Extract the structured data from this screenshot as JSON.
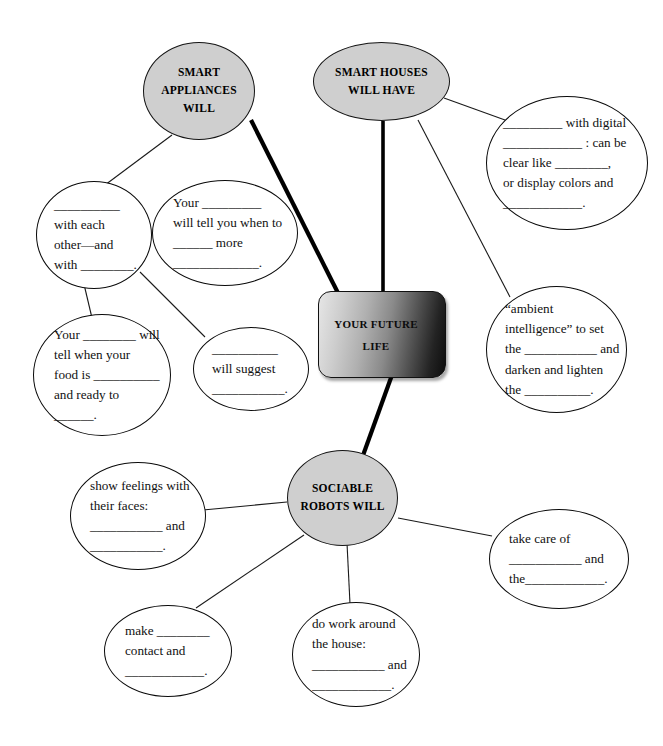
{
  "diagram": {
    "center": {
      "label_line1": "YOUR FUTURE",
      "label_line2": "LIFE",
      "shape": "rounded-rectangle",
      "fill_gradient_from": "#e6e6e6",
      "fill_gradient_to": "#0d0d0d"
    },
    "main_nodes": [
      {
        "id": "smart-appliances",
        "line1": "SMART",
        "line2": "APPLIANCES",
        "line3": "WILL",
        "fill": "#cfcfcf"
      },
      {
        "id": "smart-houses",
        "line1": "SMART HOUSES",
        "line2": "WILL HAVE",
        "line3": "",
        "fill": "#cfcfcf"
      },
      {
        "id": "sociable-robots",
        "line1": "SOCIABLE",
        "line2": "ROBOTS WILL",
        "line3": "",
        "fill": "#cfcfcf"
      }
    ],
    "detail_bubbles": [
      {
        "id": "appliances-talk",
        "parent": "smart-appliances",
        "lines": [
          "__________",
          "with each",
          "other—and",
          "with ________."
        ]
      },
      {
        "id": "appliances-remind",
        "parent": "smart-appliances",
        "lines": [
          "Your _________",
          "will tell you when to",
          "______ more",
          "_____________."
        ]
      },
      {
        "id": "appliances-food",
        "parent": "appliances-talk",
        "lines": [
          "Your ________ will",
          "tell when your",
          "food is __________",
          "and ready to",
          "______."
        ]
      },
      {
        "id": "appliances-suggest",
        "parent": "smart-appliances",
        "lines": [
          "__________",
          "will suggest",
          "___________."
        ]
      },
      {
        "id": "houses-windows",
        "parent": "smart-houses",
        "lines": [
          "_________ with digital",
          "____________ : can be",
          "clear like ________,",
          "or display colors and",
          "____________."
        ]
      },
      {
        "id": "houses-ambient",
        "parent": "smart-houses",
        "lines": [
          "“ambient",
          "intelligence” to set",
          "the ___________ and",
          "darken and lighten",
          "the __________."
        ]
      },
      {
        "id": "robots-feelings",
        "parent": "sociable-robots",
        "lines": [
          "show feelings with",
          "their faces:",
          "___________ and",
          "___________."
        ]
      },
      {
        "id": "robots-care",
        "parent": "sociable-robots",
        "lines": [
          "take care of",
          "___________ and",
          "the____________."
        ]
      },
      {
        "id": "robots-contact",
        "parent": "sociable-robots",
        "lines": [
          "make ________",
          "contact and",
          "____________."
        ]
      },
      {
        "id": "robots-housework",
        "parent": "sociable-robots",
        "lines": [
          "do work around",
          "the house:",
          "___________ and",
          "____________."
        ]
      }
    ]
  }
}
